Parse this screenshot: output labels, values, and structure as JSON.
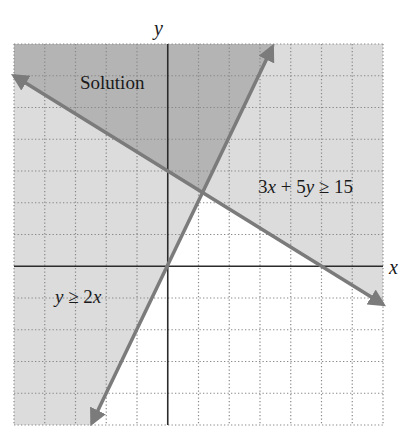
{
  "chart_data": {
    "type": "line",
    "title": "",
    "xlabel": "x",
    "ylabel": "y",
    "xlim": [
      -5,
      7
    ],
    "ylim": [
      -5,
      7
    ],
    "grid": true,
    "grid_step": 1,
    "series": [
      {
        "name": "y ≥ 2x",
        "boundary": "y = 2x",
        "slope": 2,
        "intercept": 0,
        "x": [
          -2.5,
          3.5
        ],
        "y": [
          -5,
          7
        ],
        "shaded_side": "above-left"
      },
      {
        "name": "3x + 5y ≥ 15",
        "boundary": "3x + 5y = 15",
        "slope": -0.6,
        "intercept": 3,
        "x": [
          -5,
          7
        ],
        "y": [
          6,
          -1.2
        ],
        "shaded_side": "above-right"
      }
    ],
    "intersection": {
      "x": 1.154,
      "y": 2.308
    },
    "annotations": [
      {
        "text": "Solution",
        "x": -2.4,
        "y": 5.9
      },
      {
        "text": "3x + 5y ≥ 15",
        "x": 5.2,
        "y": 2.6
      },
      {
        "text": "y ≥ 2x",
        "x": -3.3,
        "y": -1.0
      }
    ],
    "colors": {
      "solution_region": "#b4b4b4",
      "single_region": "#dcdcdc",
      "boundary_lines": "#7b7b7b",
      "axes": "#2b2b2b",
      "grid": "#888888"
    }
  },
  "labels": {
    "x_axis": "x",
    "y_axis": "y",
    "solution": "Solution",
    "ineq1_pre": "3",
    "ineq1_x": "x",
    "ineq1_mid": " + 5",
    "ineq1_y": "y",
    "ineq1_post": " ≥ 15",
    "ineq2_y": "y",
    "ineq2_mid": " ≥ 2",
    "ineq2_x": "x"
  }
}
